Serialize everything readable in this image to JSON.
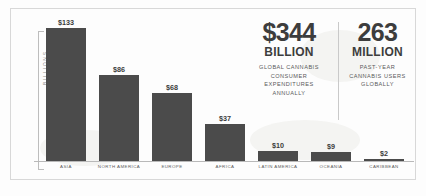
{
  "chart_data": {
    "type": "bar",
    "title": "",
    "xlabel": "",
    "ylabel": "BILLIONS",
    "ylim": [
      0,
      140
    ],
    "grid": false,
    "legend": "none",
    "value_prefix": "$",
    "categories": [
      "ASIA",
      "NORTH AMERICA",
      "EUROPE",
      "AFRICA",
      "LATIN AMERICA",
      "OCEANIA",
      "CARIBBEAN"
    ],
    "values": [
      133,
      86,
      68,
      37,
      10,
      9,
      2
    ],
    "value_labels": [
      "$133",
      "$86",
      "$68",
      "$37",
      "$10",
      "$9",
      "$2"
    ],
    "bars": [
      {
        "category": "ASIA",
        "value": 133,
        "label": "$133"
      },
      {
        "category": "NORTH AMERICA",
        "value": 86,
        "label": "$86"
      },
      {
        "category": "EUROPE",
        "value": 68,
        "label": "$68"
      },
      {
        "category": "AFRICA",
        "value": 37,
        "label": "$37"
      },
      {
        "category": "LATIN AMERICA",
        "value": 10,
        "label": "$10"
      },
      {
        "category": "OCEANIA",
        "value": 9,
        "label": "$9"
      },
      {
        "category": "CARIBBEAN",
        "value": 2,
        "label": "$2"
      }
    ],
    "colors": {
      "bar": "#4b4b4b",
      "axis": "#b9b9b9",
      "text": "#3d3d3d",
      "muted": "#5d5d5d",
      "frame": "#d8d8d8"
    }
  },
  "stats": [
    {
      "number": "$344",
      "unit": "BILLION",
      "description": "GLOBAL CANNABIS\nCONSUMER\nEXPENDITURES\nANNUALLY"
    },
    {
      "number": "263",
      "unit": "MILLION",
      "description": "PAST-YEAR\nCANNABIS USERS\nGLOBALLY"
    }
  ]
}
